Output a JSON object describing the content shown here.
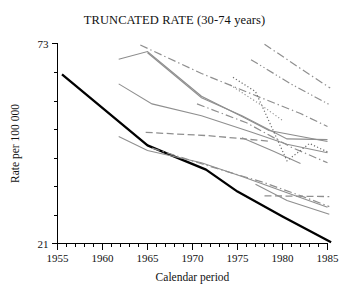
{
  "chart_data": {
    "type": "line",
    "title": "TRUNCATED RATE (30-74 years)",
    "xlabel": "Calendar period",
    "ylabel": "Rate per 100 000",
    "xlim": [
      1955,
      1985
    ],
    "ylim": [
      21,
      73
    ],
    "grid": false,
    "legend": "none",
    "x_ticks_major": [
      1955,
      1960,
      1965,
      1970,
      1975,
      1980,
      1985
    ],
    "x_tick_labels": [
      "1955",
      "1960",
      "1965",
      "1970",
      "1975",
      "1980",
      "1985"
    ],
    "x_tick_minor_step": 1,
    "y_ticks_labeled": [
      21,
      73
    ],
    "y_tick_labels": [
      "21",
      "73"
    ],
    "y_ticks_minor": [
      28.4,
      35.8,
      43.2,
      50.6,
      58.0,
      65.4
    ],
    "series": [
      {
        "name": "reference-bold",
        "style": "solid",
        "color": "#000000",
        "width": 2.3,
        "x": [
          1955.5,
          1965.0,
          1968.0,
          1971.5,
          1975.0,
          1980.0,
          1985.4
        ],
        "values": [
          65.0,
          46.5,
          43.6,
          40.2,
          34.5,
          28.0,
          21.3
        ]
      },
      {
        "name": "grey-solid-peak-1965",
        "style": "solid",
        "color": "#8c8c8c",
        "width": 1.1,
        "x": [
          1961.8,
          1965.0,
          1971.0,
          1975.5,
          1978.5,
          1985.0
        ],
        "values": [
          68.9,
          70.9,
          59.3,
          54.0,
          50.4,
          47.5
        ]
      },
      {
        "name": "grey-solid-top-start-1965",
        "style": "solid",
        "color": "#8f8f8f",
        "width": 1.1,
        "x": [
          1965.0,
          1971.0,
          1975.5,
          1980.5,
          1985.0
        ],
        "values": [
          70.6,
          58.9,
          54.2,
          48.2,
          48.0
        ]
      },
      {
        "name": "grey-solid-mid-1962",
        "style": "solid",
        "color": "#8f8f8f",
        "width": 1.1,
        "x": [
          1961.8,
          1965.5,
          1971.0,
          1976.5,
          1980.5,
          1985.0
        ],
        "values": [
          62.5,
          57.3,
          54.2,
          50.0,
          46.8,
          44.6
        ]
      },
      {
        "name": "grey-solid-low-1962",
        "style": "solid",
        "color": "#8f8f8f",
        "width": 1.1,
        "x": [
          1961.8,
          1965.0,
          1971.0,
          1975.5,
          1980.5,
          1985.0
        ],
        "values": [
          48.8,
          45.2,
          42.0,
          38.4,
          34.2,
          30.4
        ]
      },
      {
        "name": "grey-solid-right-1977",
        "style": "solid",
        "color": "#8f8f8f",
        "width": 1.1,
        "x": [
          1977.0,
          1980.5,
          1985.2
        ],
        "values": [
          36.4,
          32.2,
          28.6
        ]
      },
      {
        "name": "grey-solid-short-1976",
        "style": "solid",
        "color": "#8f8f8f",
        "width": 1.1,
        "x": [
          1975.5,
          1979.0,
          1982.0
        ],
        "values": [
          48.5,
          45.0,
          41.8
        ]
      },
      {
        "name": "dashdot-upper-1964",
        "style": "dashdot",
        "color": "#8f8f8f",
        "width": 1.2,
        "x": [
          1964.2,
          1971.0,
          1977.5,
          1982.0,
          1985.0
        ],
        "values": [
          72.6,
          65.2,
          59.0,
          54.8,
          51.4
        ]
      },
      {
        "name": "dashdot-upper-right-1978",
        "style": "dashdot",
        "color": "#8f8f8f",
        "width": 1.2,
        "x": [
          1978.0,
          1982.0,
          1985.3
        ],
        "values": [
          72.8,
          66.5,
          61.4
        ]
      },
      {
        "name": "dashdotdot-right-1976",
        "style": "dashdotdot",
        "color": "#8f8f8f",
        "width": 1.2,
        "x": [
          1976.5,
          1981.0,
          1985.3
        ],
        "values": [
          68.8,
          62.4,
          57.0
        ]
      },
      {
        "name": "dashdot-mid-1970",
        "style": "dashdot",
        "color": "#8f8f8f",
        "width": 1.2,
        "x": [
          1970.5,
          1976.0,
          1981.0,
          1985.0
        ],
        "values": [
          57.3,
          52.4,
          46.0,
          42.0
        ]
      },
      {
        "name": "dashdot-lower-1965",
        "style": "dashdot",
        "color": "#8f8f8f",
        "width": 1.2,
        "x": [
          1965.5,
          1972.0,
          1978.0,
          1982.5,
          1985.2
        ],
        "values": [
          45.8,
          41.0,
          36.8,
          33.0,
          30.6
        ]
      },
      {
        "name": "dashed-long-horizontal",
        "style": "dashed",
        "color": "#8f8f8f",
        "width": 1.3,
        "x": [
          1964.8,
          1972.0,
          1978.5
        ],
        "values": [
          49.9,
          49.0,
          47.6
        ]
      },
      {
        "name": "dashed-low-horizontal-right",
        "style": "dashed",
        "color": "#8f8f8f",
        "width": 1.3,
        "x": [
          1978.0,
          1985.2
        ],
        "values": [
          33.4,
          33.2
        ]
      },
      {
        "name": "dotted-v-shape",
        "style": "dotted",
        "color": "#6e6e6e",
        "width": 1.2,
        "x": [
          1974.5,
          1977.0,
          1980.5,
          1983.0,
          1985.2
        ],
        "values": [
          64.2,
          60.5,
          42.5,
          47.0,
          44.6
        ]
      },
      {
        "name": "dotted-upper-1974",
        "style": "dotted",
        "color": "#8f8f8f",
        "width": 1.1,
        "x": [
          1974.2,
          1977.5,
          1980.0
        ],
        "values": [
          62.2,
          57.2,
          53.0
        ]
      }
    ]
  },
  "figure": {
    "width": 349,
    "height": 291,
    "background": "#ffffff",
    "axis_color": "#000000",
    "series_grey": "#8f8f8f",
    "series_black": "#000000"
  }
}
